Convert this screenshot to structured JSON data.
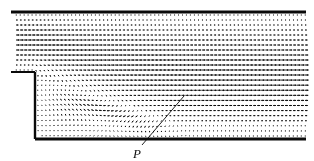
{
  "figure": {
    "type": "cfd-velocity-vector-field",
    "background_color": "#ffffff",
    "ink_color": "#0a0a0a",
    "width": 314,
    "height": 161
  },
  "annotations": [
    {
      "id": "point-p",
      "text": "P",
      "style": "italic",
      "label_x": 133,
      "label_y": 147,
      "leader_line": {
        "from_x": 142,
        "from_y": 145,
        "to_x": 184,
        "to_y": 96,
        "stroke_width": 0.9
      }
    }
  ],
  "geometry": {
    "inlet_channel": {
      "x_start": 11,
      "x_end": 306,
      "y_top": 12,
      "y_bottom": 72
    },
    "expanded_channel": {
      "x_start": 35,
      "x_end": 306,
      "y_top": 72,
      "y_bottom": 139
    },
    "step": {
      "corner_x": 35,
      "corner_y": 72,
      "height": 67
    },
    "walls": [
      {
        "name": "top-wall",
        "x1": 11,
        "y1": 12,
        "x2": 306,
        "y2": 12,
        "width": 3.2
      },
      {
        "name": "step-top-wall",
        "x1": 11,
        "y1": 72,
        "x2": 35,
        "y2": 72,
        "width": 2.0
      },
      {
        "name": "step-face-wall",
        "x1": 35,
        "y1": 72,
        "x2": 35,
        "y2": 139,
        "width": 2.4
      },
      {
        "name": "bottom-wall",
        "x1": 35,
        "y1": 139,
        "x2": 306,
        "y2": 139,
        "width": 3.0
      }
    ]
  },
  "chart_data": {
    "type": "scatter",
    "title": "",
    "xlabel": "",
    "ylabel": "",
    "grid": false,
    "legend": null,
    "vector_grid": {
      "upper_region": {
        "x_min": 16,
        "x_max": 305,
        "y_min": 15,
        "y_max": 70,
        "columns": 74,
        "rows": 12,
        "arrow_scale": 3.6,
        "note": "Fully-developed horizontal inflow; arrows point in +x direction with parabolic magnitude across the channel."
      },
      "lower_region": {
        "x_min": 38,
        "x_max": 305,
        "y_min": 75,
        "y_max": 136,
        "columns": 68,
        "rows": 13,
        "arrow_scale": 3.6,
        "note": "Recirculation bubble behind the step, free shear layer, and downstream recovery toward channel flow."
      }
    },
    "flow_features": [
      {
        "name": "inlet-uniform-flow",
        "x_range": [
          11,
          306
        ],
        "y_range": [
          12,
          72
        ],
        "direction": "+x"
      },
      {
        "name": "separated-shear-layer",
        "x_range": [
          35,
          200
        ],
        "y_range": [
          72,
          100
        ],
        "direction": "+x with downward deflection"
      },
      {
        "name": "recirculation-bubble",
        "x_range": [
          35,
          135
        ],
        "y_range": [
          75,
          139
        ],
        "direction": "clockwise reversed flow"
      },
      {
        "name": "reattachment-point",
        "x": 184,
        "y": 96,
        "label": "P"
      },
      {
        "name": "downstream-recovery",
        "x_range": [
          200,
          306
        ],
        "y_range": [
          72,
          139
        ],
        "direction": "+x"
      }
    ],
    "reattachment": {
      "label": "P",
      "x": 184,
      "y": 96
    }
  }
}
